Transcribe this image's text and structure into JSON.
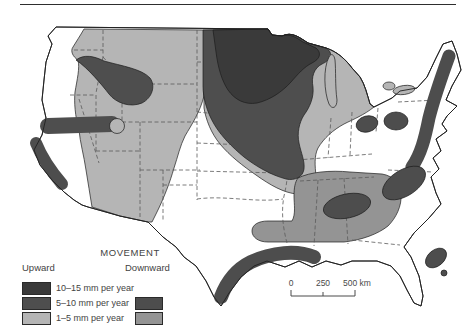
{
  "colors": {
    "up_10_15": "#3a3a3a",
    "up_5_10": "#4e4e4e",
    "up_1_5": "#b5b5b5",
    "down_5_10": "#4d4d4d",
    "down_1_5": "#949494"
  },
  "legend": {
    "title": "MOVEMENT",
    "upward_label": "Upward",
    "downward_label": "Downward",
    "rows": [
      {
        "label": "10–15 mm per year"
      },
      {
        "label": "5–10 mm per year"
      },
      {
        "label": "1–5 mm per year"
      }
    ]
  },
  "scale": {
    "labels": [
      "0",
      "250",
      "500 km"
    ]
  },
  "map": {
    "regions": [
      {
        "area": "upper-midwest-core",
        "movement": "upward",
        "rate": "10–15 mm per year"
      },
      {
        "area": "upper-midwest-ring",
        "movement": "upward",
        "rate": "5–10 mm per year"
      },
      {
        "area": "interior-west",
        "movement": "upward",
        "rate": "1–5 mm per year"
      },
      {
        "area": "great-lakes-fringe",
        "movement": "upward",
        "rate": "1–5 mm per year"
      },
      {
        "area": "idaho-montana-blob",
        "movement": "upward",
        "rate": "5–10 mm per year"
      },
      {
        "area": "nevada-utah-band",
        "movement": "upward",
        "rate": "5–10 mm per year"
      },
      {
        "area": "california-coast-band",
        "movement": "downward",
        "rate": "5–10 mm per year"
      },
      {
        "area": "gulf-coast-band",
        "movement": "downward",
        "rate": "5–10 mm per year"
      },
      {
        "area": "atlantic-appalachian-band",
        "movement": "downward",
        "rate": "5–10 mm per year"
      },
      {
        "area": "carolinas-coast-oval",
        "movement": "downward",
        "rate": "5–10 mm per year"
      },
      {
        "area": "ohio-valley-ovals",
        "movement": "downward",
        "rate": "5–10 mm per year"
      },
      {
        "area": "southeast-interior",
        "movement": "downward",
        "rate": "1–5 mm per year"
      },
      {
        "area": "southeast-interior-core",
        "movement": "downward",
        "rate": "5–10 mm per year"
      },
      {
        "area": "florida-east-coast",
        "movement": "downward",
        "rate": "5–10 mm per year"
      }
    ]
  }
}
